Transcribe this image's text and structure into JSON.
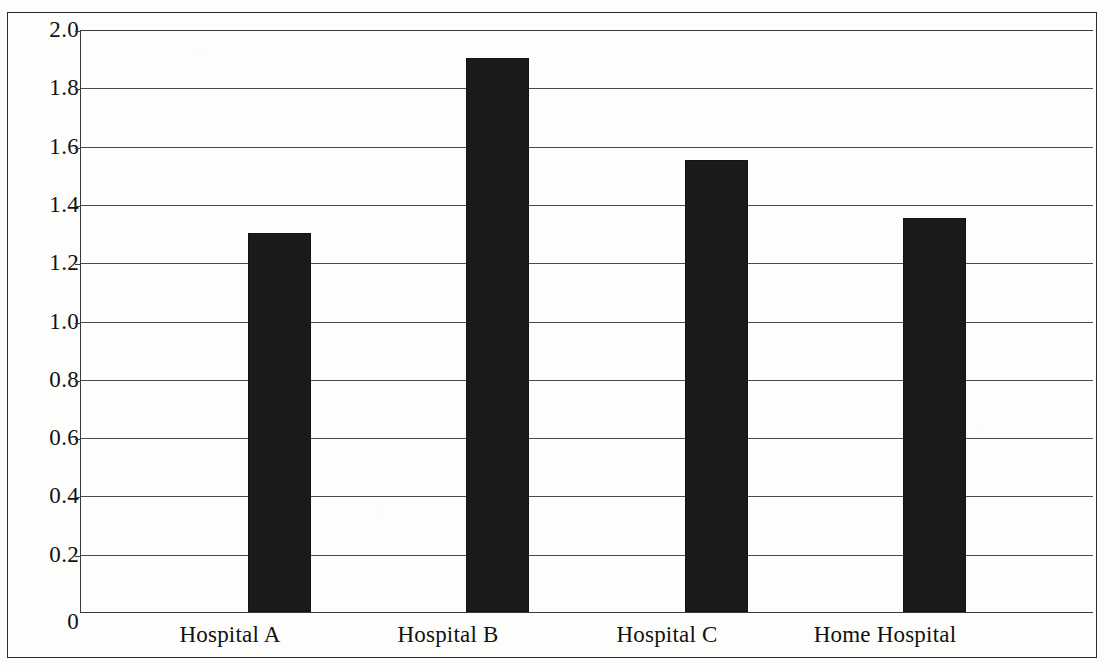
{
  "chart_data": {
    "type": "bar",
    "title": "",
    "subtitle": "",
    "xlabel": "",
    "ylabel": "",
    "categories": [
      "Hospital A",
      "Hospital B",
      "Hospital C",
      "Home Hospital"
    ],
    "values": [
      1.3,
      1.9,
      1.55,
      1.35
    ],
    "series": [
      {
        "name": "",
        "values": [
          1.3,
          1.9,
          1.55,
          1.35
        ]
      }
    ],
    "ylim": [
      0,
      2.0
    ],
    "ytick_values": [
      2.0,
      1.8,
      1.6,
      1.4,
      1.2,
      1.0,
      0.8,
      0.6,
      0.4,
      0.2,
      0
    ],
    "ytick_labels": [
      "2.0",
      "1.8",
      "1.6",
      "1.4",
      "1.2",
      "1.0",
      "0.8",
      "0.6",
      "0.4",
      "0.2",
      "0"
    ],
    "grid": true,
    "grid_axis": "y",
    "legend": false,
    "legend_position": "none",
    "bar_color": "#1a1a1a",
    "axis_color": "#3a3a3a",
    "gridline_color": "#4a4a4a",
    "background_color": "#fdfdfc",
    "frame_border_color": "#2c2c2c",
    "annotations": []
  }
}
